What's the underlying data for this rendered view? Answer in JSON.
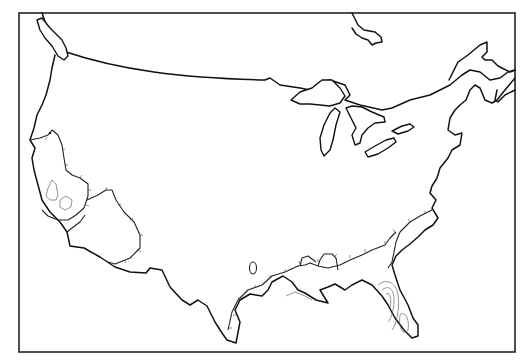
{
  "map": {
    "title": "",
    "frame": {
      "x": 19,
      "y": 13,
      "width": 496,
      "height": 339,
      "stroke": "#222222"
    },
    "background": "#ffffff",
    "line_color": "#111111",
    "contour_color": "#666666",
    "features": [
      {
        "id": "us-outline",
        "type": "coastline-and-border",
        "label": "Contiguous United States outline"
      },
      {
        "id": "vancouver-island",
        "type": "island"
      },
      {
        "id": "great-lakes",
        "type": "lakes",
        "items": [
          "Lake Superior",
          "Lake Michigan",
          "Lake Huron",
          "Lake Erie",
          "Lake Ontario"
        ]
      },
      {
        "id": "hudson-bay-tip",
        "type": "water"
      },
      {
        "id": "gulf-of-st-lawrence",
        "type": "water"
      },
      {
        "id": "california-central-valley-region",
        "type": "hatched-region"
      },
      {
        "id": "southwest-desert-region",
        "type": "hatched-region"
      },
      {
        "id": "gulf-coast-band",
        "type": "hatched-region"
      },
      {
        "id": "atlantic-coast-band",
        "type": "hatched-region"
      },
      {
        "id": "florida-contours",
        "type": "contour-region"
      },
      {
        "id": "inland-oval",
        "type": "small-closed-region"
      }
    ]
  }
}
